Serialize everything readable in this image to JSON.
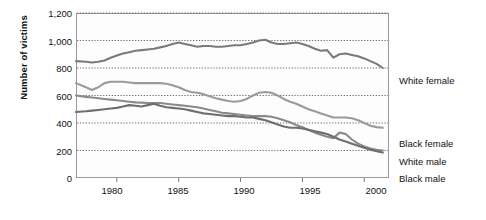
{
  "chart_data": {
    "type": "line",
    "title": "",
    "xlabel": "",
    "ylabel": "Number of victims",
    "xlim": [
      1976.7,
      2002.0
    ],
    "ylim": [
      0,
      1200
    ],
    "yticks": [
      0,
      200,
      400,
      600,
      800,
      1000,
      1200
    ],
    "ytick_labels": [
      "0",
      "200",
      "400",
      "600",
      "800",
      "1,000",
      "1,200"
    ],
    "xticks": [
      1980,
      1985,
      1990,
      1995,
      2000
    ],
    "xtick_labels": [
      "1980",
      "1985",
      "1990",
      "1995",
      "2000"
    ],
    "grid": "horizontal-dotted",
    "legend_position": "right-inline-end-of-line",
    "x": [
      1976.7,
      1977.5,
      1978,
      1978.5,
      1979,
      1979.5,
      1980,
      1980.5,
      1981,
      1981.5,
      1982,
      1982.5,
      1983,
      1983.5,
      1984,
      1984.5,
      1985,
      1985.5,
      1986,
      1986.5,
      1987,
      1987.5,
      1988,
      1988.5,
      1989,
      1989.5,
      1990,
      1990.5,
      1991,
      1991.5,
      1992,
      1992.5,
      1993,
      1993.5,
      1994,
      1994.5,
      1995,
      1995.5,
      1996,
      1996.5,
      1997,
      1997.5,
      1998,
      1998.5,
      1999,
      1999.5,
      2000,
      2000.5,
      2001,
      2001.5
    ],
    "series": [
      {
        "name": "Black male",
        "label": "Black male",
        "color": "#7a7a7a",
        "label_y_px": 178,
        "values": [
          850,
          845,
          840,
          845,
          855,
          875,
          890,
          905,
          915,
          925,
          930,
          935,
          940,
          950,
          960,
          975,
          985,
          975,
          965,
          955,
          960,
          960,
          955,
          955,
          960,
          965,
          965,
          975,
          985,
          1000,
          1005,
          985,
          975,
          975,
          980,
          985,
          975,
          960,
          940,
          925,
          930,
          875,
          900,
          905,
          895,
          885,
          870,
          850,
          830,
          800
        ]
      },
      {
        "name": "White male",
        "label": "White male",
        "color": "#9a9a9a",
        "label_y_px": 161,
        "values": [
          690,
          660,
          640,
          660,
          690,
          700,
          700,
          700,
          695,
          690,
          690,
          690,
          690,
          690,
          685,
          675,
          660,
          640,
          625,
          620,
          610,
          595,
          580,
          570,
          560,
          555,
          560,
          575,
          600,
          620,
          625,
          620,
          600,
          575,
          555,
          540,
          520,
          500,
          485,
          470,
          455,
          440,
          440,
          440,
          435,
          420,
          400,
          380,
          370,
          365
        ]
      },
      {
        "name": "Black female",
        "label": "Black female",
        "color": "#8a8a8a",
        "label_y_px": 143,
        "values": [
          600,
          590,
          585,
          580,
          575,
          570,
          565,
          560,
          555,
          550,
          548,
          545,
          545,
          545,
          540,
          535,
          530,
          525,
          520,
          515,
          505,
          495,
          485,
          475,
          470,
          465,
          460,
          455,
          450,
          450,
          450,
          445,
          435,
          420,
          405,
          385,
          370,
          350,
          330,
          315,
          300,
          290,
          330,
          320,
          280,
          250,
          230,
          215,
          205,
          200
        ]
      },
      {
        "name": "White female",
        "label": "White female",
        "color": "#6e6e6e",
        "label_y_px": 80,
        "values": [
          480,
          485,
          490,
          495,
          500,
          505,
          510,
          520,
          530,
          525,
          520,
          530,
          540,
          525,
          515,
          510,
          505,
          500,
          490,
          480,
          470,
          465,
          460,
          455,
          450,
          450,
          445,
          440,
          440,
          430,
          420,
          405,
          390,
          375,
          365,
          365,
          360,
          350,
          340,
          330,
          320,
          300,
          280,
          265,
          250,
          235,
          220,
          205,
          195,
          185
        ]
      }
    ]
  },
  "axes": {
    "ylabel": "Number of victims"
  }
}
